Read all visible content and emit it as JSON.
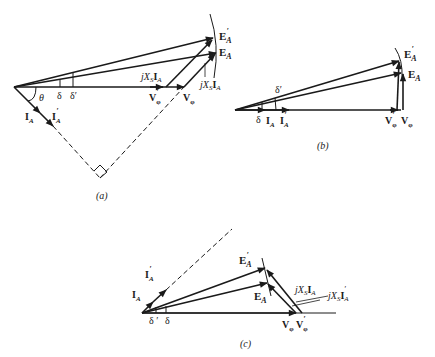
{
  "figure": {
    "panels": [
      {
        "id": "a",
        "caption": "(a)",
        "labels": {
          "ea_prime": "E",
          "ea_prime_sub": "A",
          "ea": "E",
          "ea_sub": "A",
          "jxs_upper": "jX",
          "jxs_upper_sub": "S",
          "jxs_upper_i": "I",
          "jxs_upper_isub": "A",
          "jxs_lower": "jX",
          "jxs_lower_sub": "S",
          "jxs_lower_i": "I",
          "jxs_lower_isub": "A",
          "theta": "θ",
          "delta": "δ",
          "delta_prime": "δ′",
          "v_phi_prime": "V",
          "v_phi": "V",
          "phi_sub": "φ",
          "ia": "I",
          "ia_sub": "A",
          "ia_prime": "I",
          "ia_prime_sub": "A",
          "prime": "′"
        }
      },
      {
        "id": "b",
        "caption": "(b)",
        "labels": {
          "ea_prime": "E",
          "ea": "E",
          "sub_a": "A",
          "delta": "δ",
          "delta_prime": "δ′",
          "ia": "I",
          "ia_prime": "I",
          "v_phi_prime": "V",
          "v_phi": "V",
          "phi_sub": "φ",
          "prime": "′"
        }
      },
      {
        "id": "c",
        "caption": "(c)",
        "labels": {
          "ea_prime": "E",
          "ea": "E",
          "sub_a": "A",
          "ia": "I",
          "ia_prime": "I",
          "delta_prime": "δ ′",
          "delta": "δ",
          "jxs_ia": "jX",
          "jxs_ia_prime": "jX",
          "s_sub": "S",
          "i": "I",
          "v_phi": "V",
          "v_phi_prime": "V",
          "phi_sub": "φ",
          "prime": "′"
        }
      }
    ],
    "colors": {
      "ink": "#1a1a1a",
      "background": "#ffffff"
    }
  }
}
